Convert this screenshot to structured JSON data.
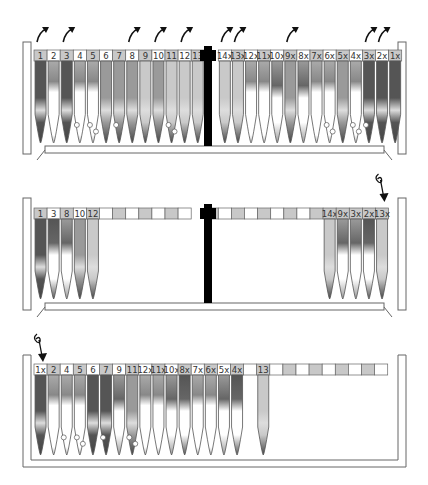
{
  "colors": {
    "cell_gray": "#c8c8c8",
    "cell_white": "#ffffff",
    "tube_dark": "#555555",
    "tube_mid": "#9a9a9a",
    "tube_light": "#c9c9c9",
    "divider": "#000000",
    "frame": "#777777"
  },
  "panels": [
    {
      "id": "top",
      "title": "Initial rack",
      "slots": [
        {
          "label": "1",
          "tube": "dark",
          "arrow": "up-out"
        },
        {
          "label": "2",
          "tube": "white-band"
        },
        {
          "label": "3",
          "tube": "dark",
          "arrow": "up-out"
        },
        {
          "label": "4",
          "tube": "white-bead"
        },
        {
          "label": "5",
          "tube": "white-beads"
        },
        {
          "label": "6",
          "tube": "mid"
        },
        {
          "label": "7",
          "tube": "mid-bead"
        },
        {
          "label": "8",
          "tube": "mid",
          "arrow": "up-out"
        },
        {
          "label": "9",
          "tube": "light"
        },
        {
          "label": "10",
          "tube": "mid",
          "arrow": "up-out"
        },
        {
          "label": "11",
          "tube": "light-beads"
        },
        {
          "label": "12",
          "tube": "light",
          "arrow": "up-out"
        },
        {
          "label": "13",
          "tube": "light"
        },
        {
          "label": "14x",
          "tube": "light",
          "arrow": "up-out"
        },
        {
          "label": "13x",
          "tube": "light",
          "arrow": "up-out"
        },
        {
          "label": "12x",
          "tube": "white-band"
        },
        {
          "label": "11x",
          "tube": "white-band"
        },
        {
          "label": "10x",
          "tube": "mid-band"
        },
        {
          "label": "9x",
          "tube": "mid",
          "arrow": "up-out"
        },
        {
          "label": "8x",
          "tube": "mid-band"
        },
        {
          "label": "7x",
          "tube": "white-band"
        },
        {
          "label": "6x",
          "tube": "white-beads"
        },
        {
          "label": "5x",
          "tube": "mid"
        },
        {
          "label": "4x",
          "tube": "white-beads"
        },
        {
          "label": "3x",
          "tube": "dark-bead",
          "arrow": "up-out"
        },
        {
          "label": "2x",
          "tube": "dark",
          "arrow": "up-out"
        },
        {
          "label": "1x",
          "tube": "dark"
        }
      ]
    },
    {
      "id": "middle",
      "title": "Removed tubes",
      "left_slots": [
        "1",
        "3",
        "8",
        "10",
        "12"
      ],
      "right_slots": [
        "14x",
        "9x",
        "3x",
        "2x",
        "13x"
      ],
      "empty_cells": 14,
      "insert_arrow_on": "13x"
    },
    {
      "id": "bottom",
      "title": "Reordered rack",
      "slots": [
        "1x",
        "2",
        "4",
        "5",
        "6",
        "7",
        "9",
        "11",
        "12x",
        "11x",
        "10x",
        "8x",
        "7x",
        "6x",
        "5x",
        "4x",
        "",
        "13",
        "",
        "",
        "",
        "",
        "",
        "",
        "",
        "",
        ""
      ],
      "insert_arrow_on": "1x"
    }
  ]
}
